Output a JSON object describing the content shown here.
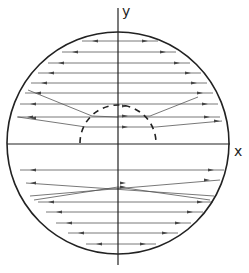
{
  "diagram": {
    "type": "ray-trace-in-circle",
    "axes": {
      "x_label": "x",
      "y_label": "y"
    },
    "colors": {
      "stroke": "#222222",
      "ray": "#555555",
      "background": "#ffffff"
    },
    "outer_circle": {
      "cx": 118,
      "cy": 143,
      "r": 111
    },
    "inner_dashed_semicircle": {
      "cx": 118,
      "cy": 143,
      "r": 38
    },
    "x_axis": {
      "x1": 7,
      "x2": 230,
      "y": 144
    },
    "y_axis": {
      "x": 118,
      "y1": 8,
      "y2": 265
    },
    "rays_upper": [
      {
        "y": 41,
        "x1": 82,
        "x2": 158,
        "dir": "both"
      },
      {
        "y": 52,
        "x1": 62,
        "x2": 176,
        "dir": "both"
      },
      {
        "y": 63,
        "x1": 48,
        "x2": 190,
        "dir": "both"
      },
      {
        "y": 73,
        "x1": 38,
        "x2": 201,
        "dir": "both"
      },
      {
        "y": 83,
        "x1": 31,
        "x2": 207,
        "dir": "both"
      },
      {
        "y": 93,
        "x1": 25,
        "x2": 213,
        "dir": "both"
      },
      {
        "y": 104,
        "x1": 20,
        "x2": 218,
        "dir": "both"
      },
      {
        "y": 117,
        "x1": 17,
        "x2": 220,
        "dir": "both"
      }
    ],
    "rays_upper_bent": [
      {
        "points": [
          [
            28,
            90
          ],
          [
            92,
            116
          ],
          [
            118,
            117
          ]
        ]
      },
      {
        "points": [
          [
            18,
            117
          ],
          [
            86,
            127
          ],
          [
            118,
            127
          ]
        ]
      },
      {
        "points": [
          [
            118,
            116
          ],
          [
            150,
            116
          ],
          [
            198,
            97
          ]
        ]
      },
      {
        "points": [
          [
            118,
            127
          ],
          [
            156,
            127
          ],
          [
            222,
            121
          ]
        ]
      }
    ],
    "rays_lower": [
      {
        "y": 170,
        "x1": 20,
        "x2": 224,
        "dir": "both"
      },
      {
        "y": 202,
        "x1": 38,
        "x2": 213,
        "dir": "both"
      },
      {
        "y": 212,
        "x1": 46,
        "x2": 203,
        "dir": "both"
      },
      {
        "y": 223,
        "x1": 56,
        "x2": 191,
        "dir": "both"
      },
      {
        "y": 233,
        "x1": 68,
        "x2": 178,
        "dir": "both"
      },
      {
        "y": 244,
        "x1": 86,
        "x2": 156,
        "dir": "both"
      }
    ],
    "rays_lower_crossing": [
      {
        "x1": 26,
        "y1": 183,
        "x2": 214,
        "y2": 196
      },
      {
        "x1": 30,
        "y1": 196,
        "x2": 220,
        "y2": 180
      },
      {
        "x1": 34,
        "y1": 200,
        "x2": 118,
        "y2": 187
      },
      {
        "x1": 118,
        "y1": 187,
        "x2": 210,
        "y2": 200
      }
    ]
  }
}
